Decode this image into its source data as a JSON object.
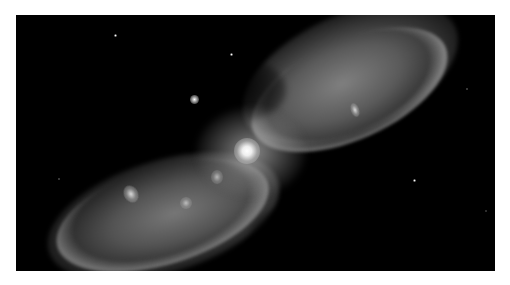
{
  "image": {
    "subject": "bipolar planetary nebula",
    "palette": "grayscale",
    "background_color": "#000000",
    "page_background_color": "#ffffff",
    "frame": {
      "left": 16,
      "top": 15,
      "width": 479,
      "height": 256
    }
  },
  "features": {
    "central_star": {
      "x": 247,
      "y": 150,
      "label": "central-star"
    },
    "lobes": [
      {
        "name": "upper-right-lobe",
        "direction": "upper-right"
      },
      {
        "name": "lower-left-lobe",
        "direction": "lower-left"
      }
    ],
    "knots": [
      {
        "name": "left-lobe-knot-1",
        "x": 131,
        "y": 192
      },
      {
        "name": "left-lobe-knot-2",
        "x": 185,
        "y": 202
      },
      {
        "name": "left-lobe-knot-3",
        "x": 215,
        "y": 175
      },
      {
        "name": "right-lobe-knot-1",
        "x": 356,
        "y": 110
      }
    ],
    "field_stars": [
      {
        "name": "bright-field-star",
        "x": 194,
        "y": 99,
        "size": 6
      },
      {
        "name": "field-star",
        "x": 231,
        "y": 54,
        "size": 3
      },
      {
        "name": "field-star",
        "x": 115,
        "y": 35,
        "size": 3
      },
      {
        "name": "field-star",
        "x": 414,
        "y": 180,
        "size": 3
      },
      {
        "name": "field-star",
        "x": 466,
        "y": 88,
        "size": 2
      },
      {
        "name": "field-star",
        "x": 58,
        "y": 178,
        "size": 2
      },
      {
        "name": "field-star",
        "x": 485,
        "y": 210,
        "size": 2
      }
    ]
  }
}
